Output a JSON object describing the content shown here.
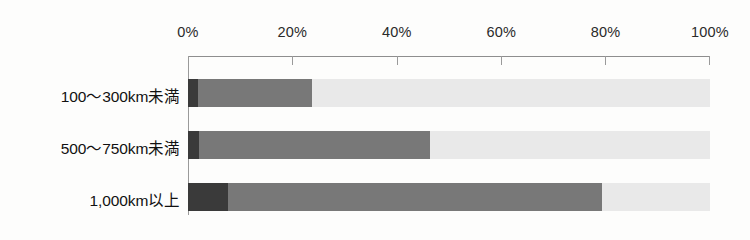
{
  "chart_data": {
    "type": "bar",
    "orientation": "horizontal",
    "stacked": true,
    "normalized_percent": true,
    "title": "",
    "xlabel": "",
    "ylabel": "",
    "xlim": [
      0,
      100
    ],
    "grid": false,
    "legend": "none",
    "axis_tick_labels": [
      "0%",
      "20%",
      "40%",
      "60%",
      "80%",
      "100%"
    ],
    "axis_tick_values": [
      0,
      20,
      40,
      60,
      80,
      100
    ],
    "categories": [
      "100〜300km未満",
      "500〜750km未満",
      "1,000km以上"
    ],
    "series": [
      {
        "name": "segment-1-dark",
        "color": "#3a3a3a",
        "values": [
          2.0,
          2.1,
          7.7
        ]
      },
      {
        "name": "segment-2-medium",
        "color": "#787878",
        "values": [
          21.8,
          44.3,
          71.6
        ]
      },
      {
        "name": "segment-3-light",
        "color": "#e9e9e9",
        "values": [
          76.2,
          53.6,
          20.7
        ]
      }
    ]
  },
  "axis": {
    "ticks": [
      {
        "label": "0%",
        "value": 0
      },
      {
        "label": "20%",
        "value": 20
      },
      {
        "label": "40%",
        "value": 40
      },
      {
        "label": "60%",
        "value": 60
      },
      {
        "label": "80%",
        "value": 80
      },
      {
        "label": "100%",
        "value": 100
      }
    ]
  },
  "rows": [
    {
      "label": "100〜300km未満",
      "segments": [
        2.0,
        21.8,
        76.2
      ]
    },
    {
      "label": "500〜750km未満",
      "segments": [
        2.1,
        44.3,
        53.6
      ]
    },
    {
      "label": "1,000km以上",
      "segments": [
        7.7,
        71.6,
        20.7
      ]
    }
  ],
  "colors": {
    "dark": "#3a3a3a",
    "medium": "#787878",
    "light": "#e9e9e9",
    "axis": "#9a9a9a",
    "background": "#fdfdfc",
    "text": "#111111"
  }
}
